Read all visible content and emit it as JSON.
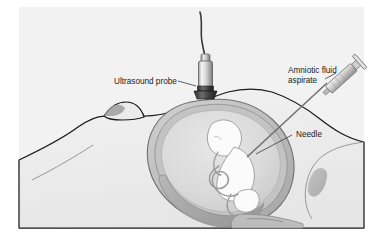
{
  "figure": {
    "background_color": "#ffffff",
    "canvas_color": "#f0f0f0",
    "width": 383,
    "height": 243
  },
  "labels": {
    "ultrasound_probe": "Ultrasound probe",
    "amniotic_fluid_line1": "Amniotic fluid",
    "amniotic_fluid_line2": "aspirate",
    "needle": "Needle"
  },
  "anatomy": {
    "maternal_abdomen": "maternal-abdomen",
    "breast": "breast",
    "uterus_wall": "uterus-wall",
    "amniotic_sac": "amniotic-sac",
    "amniotic_fluid": "amniotic-fluid",
    "fetus": "fetus",
    "umbilical_cord": "umbilical-cord",
    "placenta": "placenta",
    "cervix": "cervix",
    "bone": "bone-shadow"
  },
  "instruments": {
    "probe_body": "ultrasound-probe",
    "probe_cable": "probe-cable",
    "syringe": "syringe",
    "needle_shaft": "needle-shaft"
  },
  "colors": {
    "outline": "#1a1a1a",
    "skin_fill": "#ededed",
    "uterus_outer": "#b4b4b4",
    "uterus_mid": "#c9c9c9",
    "fluid": "#dcdcdc",
    "fetus_fill": "#fbfbfb",
    "fetus_outline": "#9a9a9a",
    "placenta": "#a9a9a9",
    "bone": "#9e9e9e",
    "metal_light": "#f2f2f2",
    "metal_mid": "#c0c0c0",
    "metal_dark": "#6e6e6e",
    "probe_base": "#3c3c3c",
    "label_text": "#1b1b1b"
  }
}
